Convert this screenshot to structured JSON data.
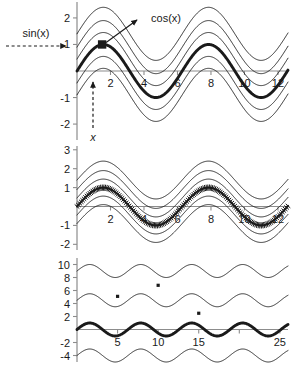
{
  "figure": {
    "title": "",
    "background": "#ffffff",
    "axis_color": "#8c8c8c",
    "curve_color": "#1a1a1a",
    "width": 291,
    "height": 366
  },
  "annotations": {
    "sin_label": "sin(x)",
    "cos_label": "cos(x)",
    "x_label": "x",
    "sin_arrow": "dashed-arrow-right",
    "cos_arrow": "solid-arrow-up-right",
    "x_arrow": "dashed-arrow-up",
    "marker": "filled-square-marker"
  },
  "chart_data": [
    {
      "id": "panel-top",
      "type": "line",
      "title": "",
      "xlabel": "",
      "ylabel": "",
      "xlim": [
        0,
        12.6
      ],
      "ylim": [
        -2.6,
        2.6
      ],
      "xticks": [
        2,
        4,
        6,
        8,
        10,
        12
      ],
      "xtick_labels": [
        "2",
        "4",
        "6",
        "8",
        "10",
        "12"
      ],
      "yticks": [
        2,
        1,
        -1,
        -2
      ],
      "ytick_labels": [
        "2",
        "1",
        "-1",
        "-2"
      ],
      "grid": false,
      "legend": "none",
      "series": [
        {
          "name": "sin(x) + 1.4",
          "offset": 1.4,
          "amplitude": 1.0,
          "style": "thin"
        },
        {
          "name": "sin(x) + 0.9",
          "offset": 0.9,
          "amplitude": 1.0,
          "style": "thin"
        },
        {
          "name": "sin(x) + 0.45",
          "offset": 0.45,
          "amplitude": 1.0,
          "style": "thin"
        },
        {
          "name": "sin(x)",
          "offset": 0.0,
          "amplitude": 1.0,
          "style": "bold"
        },
        {
          "name": "sin(x) - 0.45",
          "offset": -0.45,
          "amplitude": 1.0,
          "style": "thin"
        },
        {
          "name": "sin(x) - 0.9",
          "offset": -0.9,
          "amplitude": 1.0,
          "style": "thin"
        }
      ],
      "marker_point": {
        "x": 1.5,
        "y": 1.0
      }
    },
    {
      "id": "panel-middle",
      "type": "line",
      "title": "",
      "xlabel": "",
      "ylabel": "",
      "xlim": [
        0,
        12.6
      ],
      "ylim": [
        -2.3,
        3.2
      ],
      "xticks": [
        2,
        4,
        6,
        8,
        10,
        12
      ],
      "xtick_labels": [
        "2",
        "4",
        "6",
        "8",
        "10",
        "12"
      ],
      "yticks": [
        3,
        2,
        1,
        -1,
        -2
      ],
      "ytick_labels": [
        "3",
        "2",
        "1",
        "-1",
        "-2"
      ],
      "grid": false,
      "legend": "none",
      "series": [
        {
          "name": "sin(x) + 1.4",
          "offset": 1.4,
          "amplitude": 1.0,
          "style": "thin"
        },
        {
          "name": "sin(x) + 0.9",
          "offset": 0.9,
          "amplitude": 1.0,
          "style": "thin"
        },
        {
          "name": "sin(x) + 0.45",
          "offset": 0.45,
          "amplitude": 1.0,
          "style": "thin"
        },
        {
          "name": "sin(x)",
          "offset": 0.0,
          "amplitude": 1.0,
          "style": "comb"
        },
        {
          "name": "sin(x) - 0.45",
          "offset": -0.45,
          "amplitude": 1.0,
          "style": "thin"
        },
        {
          "name": "sin(x) - 0.9",
          "offset": -0.9,
          "amplitude": 1.0,
          "style": "thin"
        }
      ]
    },
    {
      "id": "panel-bottom",
      "type": "line",
      "title": "",
      "xlabel": "",
      "ylabel": "",
      "xlim": [
        0,
        26
      ],
      "ylim": [
        -5,
        11
      ],
      "xticks": [
        5,
        10,
        15,
        20,
        25
      ],
      "xtick_labels": [
        "5",
        "10",
        "15",
        "",
        "25"
      ],
      "yticks": [
        10,
        8,
        6,
        4,
        2,
        -2,
        -4
      ],
      "ytick_labels": [
        "10",
        "8",
        "6",
        "4",
        "2",
        "-2",
        "-4"
      ],
      "grid": false,
      "legend": "none",
      "series": [
        {
          "name": "sin(x) + 9",
          "offset": 9.0,
          "amplitude": 1.0,
          "style": "thin"
        },
        {
          "name": "sin(x) + 4.5",
          "offset": 4.5,
          "amplitude": 1.0,
          "style": "thin"
        },
        {
          "name": "sin(x)",
          "offset": 0.0,
          "amplitude": 1.0,
          "style": "bold"
        },
        {
          "name": "sin(x) - 4",
          "offset": -4.0,
          "amplitude": 1.0,
          "style": "thin"
        }
      ],
      "points": [
        {
          "x": 5.0,
          "y": 5.1
        },
        {
          "x": 10.0,
          "y": 6.8
        },
        {
          "x": 15.0,
          "y": 2.5
        }
      ]
    }
  ]
}
